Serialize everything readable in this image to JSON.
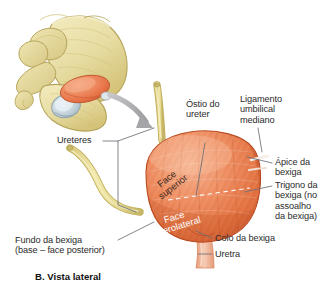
{
  "figure": {
    "caption": "B. Vista lateral",
    "background_color": "#ffffff",
    "text_color": "#2b2b2b",
    "leader_color": "#6e6e78"
  },
  "palette": {
    "bone": "#ece2a8",
    "bone_shade": "#d8c97f",
    "bone_outline": "#b9a85c",
    "bladder": "#e8744a",
    "bladder_light": "#f4a582",
    "bladder_dark": "#c9562f",
    "ureter": "#e9dd95",
    "ureter_outline": "#bfae58",
    "urethra": "#f0b49a",
    "joint": "#c9d6dd",
    "arrow": "#a9a9ad"
  },
  "labels": {
    "ureteres": "Ureteres",
    "ostio_do_ureter": "Óstio do\nureter",
    "ligamento_umbilical_mediano": "Ligamento\numbilical\nmediano",
    "apice_da_bexiga": "Ápice da\nbexiga",
    "trigono_da_bexiga": "Trigono da\nbexiga (no\nassoalho\nda bexiga)",
    "colo_da_bexiga": "Colo da bexiga",
    "uretra": "Uretra",
    "fundo_da_bexiga": "Fundo da bexiga\n(base – face posterior)"
  },
  "organ_labels": {
    "face_superior": "Face\nsuperior",
    "face_inferolateral": "Face\ninferolateral"
  },
  "structures": {
    "pelvis": "pelvic-bone-inset",
    "bladder": "urinary-bladder",
    "ureter_upper": "upper-ureter-tube",
    "ureter_lower": "lower-ureter-tube",
    "urethra": "urethra-tube",
    "trigone_line": "trigone-dashed-line",
    "arrow": "orientation-arrow"
  }
}
